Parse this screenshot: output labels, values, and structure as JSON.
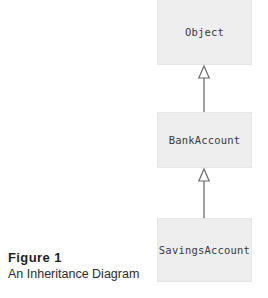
{
  "figure": {
    "caption_title": "Figure 1",
    "caption_subtitle": "An Inheritance Diagram",
    "background_color": "#ffffff"
  },
  "diagram": {
    "type": "uml-class-inheritance",
    "box_fill_color": "#eeeeee",
    "box_border_color": "#e6e6e6",
    "text_color": "#3a3a3a",
    "arrow_color": "#6b6b6b",
    "classes": [
      {
        "name": "Object"
      },
      {
        "name": "BankAccount"
      },
      {
        "name": "SavingsAccount"
      }
    ],
    "relationships": [
      {
        "from": "BankAccount",
        "to": "Object",
        "kind": "extends"
      },
      {
        "from": "SavingsAccount",
        "to": "BankAccount",
        "kind": "extends"
      }
    ]
  }
}
